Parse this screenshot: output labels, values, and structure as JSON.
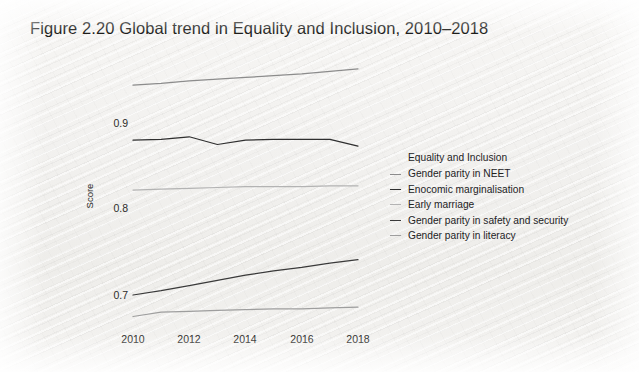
{
  "figure": {
    "title": "Figure 2.20  Global trend in Equality and Inclusion, 2010–2018"
  },
  "axes": {
    "ylabel": "Score",
    "yticks": [
      "0.9",
      "0.8",
      "0.7"
    ],
    "xticks": [
      "2010",
      "2012",
      "2014",
      "2016",
      "2018"
    ]
  },
  "legend": {
    "title": "Equality and Inclusion",
    "items": [
      {
        "label": "Gender parity in NEET",
        "color": "#8c8c8c"
      },
      {
        "label": "Enocomic marginalisation",
        "color": "#2f2f2f"
      },
      {
        "label": "Early marriage",
        "color": "#b3b3b3"
      },
      {
        "label": "Gender parity in safety and security",
        "color": "#3a3a3a"
      },
      {
        "label": "Gender parity in literacy",
        "color": "#9e9e9e"
      }
    ]
  },
  "chart_data": {
    "type": "line",
    "title": "Figure 2.20  Global trend in Equality and Inclusion, 2010–2018",
    "xlabel": "",
    "ylabel": "Score",
    "x": [
      2010,
      2011,
      2012,
      2013,
      2014,
      2015,
      2016,
      2017,
      2018
    ],
    "xlim": [
      2010,
      2018
    ],
    "ylim": [
      0.665,
      0.97
    ],
    "ytick_values": [
      0.9,
      0.8,
      0.7
    ],
    "xtick_values": [
      2010,
      2012,
      2014,
      2016,
      2018
    ],
    "grid": false,
    "legend_position": "right",
    "legend_title": "Equality and Inclusion",
    "series": [
      {
        "name": "Gender parity in NEET",
        "color": "#8c8c8c",
        "values": [
          0.944,
          0.946,
          0.949,
          0.951,
          0.953,
          0.955,
          0.957,
          0.96,
          0.963
        ]
      },
      {
        "name": "Enocomic marginalisation",
        "color": "#2f2f2f",
        "values": [
          0.88,
          0.881,
          0.884,
          0.875,
          0.88,
          0.881,
          0.881,
          0.881,
          0.873
        ]
      },
      {
        "name": "Early marriage",
        "color": "#b3b3b3",
        "values": [
          0.822,
          0.823,
          0.824,
          0.825,
          0.826,
          0.826,
          0.826,
          0.827,
          0.827
        ]
      },
      {
        "name": "Gender parity in safety and security",
        "color": "#3a3a3a",
        "values": [
          0.7,
          0.705,
          0.711,
          0.717,
          0.723,
          0.728,
          0.732,
          0.737,
          0.741
        ]
      },
      {
        "name": "Gender parity in literacy",
        "color": "#9e9e9e",
        "values": [
          0.675,
          0.68,
          0.681,
          0.682,
          0.683,
          0.684,
          0.684,
          0.685,
          0.686
        ]
      }
    ]
  }
}
